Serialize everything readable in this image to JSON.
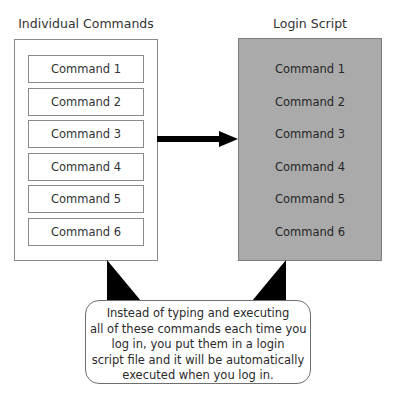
{
  "diagram": {
    "left": {
      "title": "Individual Commands",
      "commands": [
        "Command 1",
        "Command 2",
        "Command 3",
        "Command 4",
        "Command 5",
        "Command 6"
      ],
      "background": "#ffffff"
    },
    "right": {
      "title": "Login Script",
      "commands": [
        "Command 1",
        "Command 2",
        "Command 3",
        "Command 4",
        "Command 5",
        "Command 6"
      ],
      "background": "#aaaaaa"
    },
    "arrow": {
      "direction": "left-to-right",
      "color": "#000000"
    },
    "callout": {
      "lines": [
        "Instead of typing and executing",
        "all of these commands each time you",
        "log in, you put them in a login",
        "script file and it will be automatically",
        "executed when you log in."
      ]
    }
  }
}
